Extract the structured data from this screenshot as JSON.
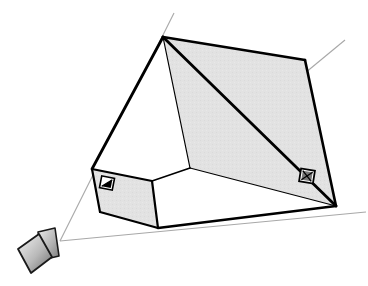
{
  "figure": {
    "type": "line-drawing",
    "width": 368,
    "height": 286,
    "background_color": "#ffffff"
  },
  "style": {
    "stroke_color": "#000000",
    "ray_color": "#a8a8a8",
    "far_plane_fill": "#e2e2e2",
    "near_plane_fill": "#e2e2e2",
    "side_face_fill": "#ffffff",
    "marker_fill": "#808080",
    "camera_gradient_light": "#f2f2f2",
    "camera_gradient_dark": "#6e6e6e",
    "thick_edge_width": 2.6,
    "thin_edge_width": 1.0,
    "ray_width": 1.0
  },
  "geometry": {
    "camera_apex": {
      "x": 60,
      "y": 241
    },
    "near_plane": {
      "label": "near clipping plane",
      "top_left": {
        "x": 92,
        "y": 169
      },
      "top_right": {
        "x": 152,
        "y": 181
      },
      "bottom_right": {
        "x": 158,
        "y": 228
      },
      "bottom_left": {
        "x": 100,
        "y": 212
      }
    },
    "far_plane": {
      "label": "far clipping plane",
      "top_left": {
        "x": 163,
        "y": 37
      },
      "top_right": {
        "x": 305,
        "y": 60
      },
      "bottom_right": {
        "x": 336,
        "y": 206
      },
      "bottom_left": {
        "x": 190,
        "y": 168
      }
    },
    "rays": [
      {
        "name": "ray-top-left",
        "from": {
          "x": 60,
          "y": 241
        },
        "to": {
          "x": 174,
          "y": 13
        }
      },
      {
        "name": "ray-top-right",
        "from": {
          "x": 190,
          "y": 168
        },
        "to": {
          "x": 345,
          "y": 40
        }
      },
      {
        "name": "ray-bottom-right",
        "from": {
          "x": 60,
          "y": 241
        },
        "to": {
          "x": 366,
          "y": 212
        }
      }
    ]
  },
  "markers": [
    {
      "name": "near-plane-marker",
      "glyph": "half-filled-square",
      "center": {
        "x": 107,
        "y": 183
      },
      "size": 13
    },
    {
      "name": "far-plane-marker",
      "glyph": "crossed-square",
      "center": {
        "x": 307,
        "y": 176
      },
      "size": 14
    }
  ],
  "camera": {
    "name": "camera-icon",
    "body": {
      "p1": {
        "x": 18,
        "y": 249
      },
      "p2": {
        "x": 39,
        "y": 234
      },
      "p3": {
        "x": 52,
        "y": 257
      },
      "p4": {
        "x": 31,
        "y": 273
      }
    },
    "lens": {
      "p1": {
        "x": 38,
        "y": 232
      },
      "p2": {
        "x": 55,
        "y": 228
      },
      "p3": {
        "x": 59,
        "y": 256
      },
      "p4": {
        "x": 42,
        "y": 260
      }
    }
  }
}
